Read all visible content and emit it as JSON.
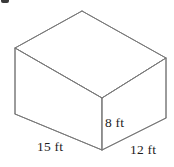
{
  "figure": {
    "shape_type": "rectangular-prism",
    "stroke_color": "#7a7a7a",
    "fill_color": "#ffffff",
    "background_color": "#ffffff",
    "text_color": "#1d1d1d",
    "labels": {
      "height": "8 ft",
      "length": "15 ft",
      "width": "12 ft"
    },
    "dimensions": {
      "height_value": 8,
      "length_value": 15,
      "width_value": 12,
      "units": "ft"
    },
    "vertices": {
      "back_top": "82,11",
      "left_top": "15,48",
      "right_top": "166,58",
      "front_top_center": "102,98",
      "left_bottom": "15,114",
      "front_bottom_center": "102,150",
      "right_bottom": "166,118"
    },
    "artifact": {
      "name": "cropped-bullet-mark"
    }
  }
}
